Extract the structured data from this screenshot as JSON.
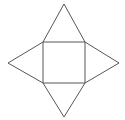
{
  "figure": {
    "name": "square-pyramid-net",
    "background_color": "#ffffff",
    "stroke_color": "#575757",
    "stroke_width": 1,
    "canvas": {
      "width": 125,
      "height": 120
    },
    "square": {
      "name": "central-square",
      "left": 43,
      "top": 42,
      "right": 85,
      "bottom": 83,
      "width": 42,
      "height": 41,
      "corners": {
        "top_left": [
          43,
          42
        ],
        "top_right": [
          85,
          42
        ],
        "bottom_right": [
          85,
          83
        ],
        "bottom_left": [
          43,
          83
        ]
      },
      "path": "M 43 42 L 85 42 L 85 83 L 43 83 Z"
    },
    "triangles": [
      {
        "name": "top-triangle",
        "apex": [
          64,
          4
        ],
        "base": [
          [
            43,
            42
          ],
          [
            85,
            42
          ]
        ],
        "path": "M 43 42 L 64 4 L 85 42"
      },
      {
        "name": "right-triangle",
        "apex": [
          119,
          63
        ],
        "base": [
          [
            85,
            42
          ],
          [
            85,
            83
          ]
        ],
        "path": "M 85 42 L 119 63 L 85 83"
      },
      {
        "name": "bottom-triangle",
        "apex": [
          64,
          117
        ],
        "base": [
          [
            85,
            83
          ],
          [
            43,
            83
          ]
        ],
        "path": "M 85 83 L 64 117 L 43 83"
      },
      {
        "name": "left-triangle",
        "apex": [
          8,
          63
        ],
        "base": [
          [
            43,
            83
          ],
          [
            43,
            42
          ]
        ],
        "path": "M 43 83 L 8 63 L 43 42"
      }
    ]
  }
}
